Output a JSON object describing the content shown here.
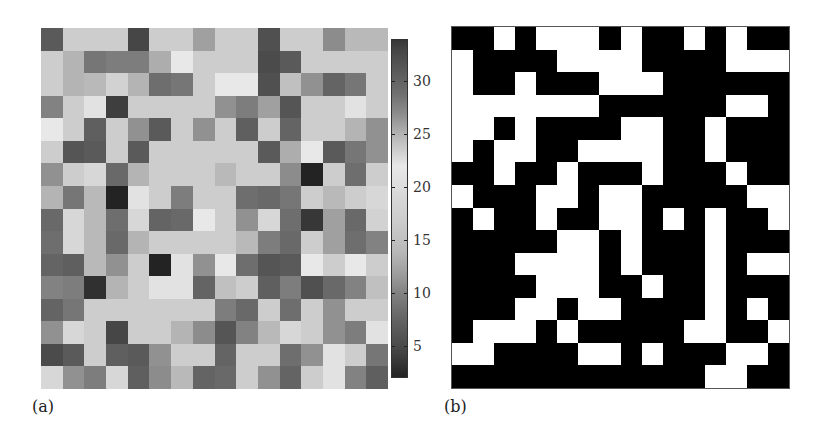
{
  "figure": {
    "panel_a_label": "(a)",
    "panel_b_label": "(b)"
  },
  "colorbar": {
    "min": 2,
    "max": 34,
    "ticks": [
      5,
      10,
      15,
      20,
      25,
      30
    ],
    "tick_labels": [
      "5",
      "10",
      "15",
      "20",
      "25",
      "30"
    ],
    "colormap_points": [
      [
        2,
        35
      ],
      [
        5,
        75
      ],
      [
        8,
        105
      ],
      [
        10,
        130
      ],
      [
        12,
        160
      ],
      [
        14,
        185
      ],
      [
        17,
        205
      ],
      [
        19,
        215
      ],
      [
        22,
        232
      ],
      [
        25,
        180
      ],
      [
        27,
        140
      ],
      [
        29,
        110
      ],
      [
        31,
        90
      ],
      [
        33,
        70
      ],
      [
        34,
        55
      ]
    ]
  },
  "chart_data": [
    {
      "type": "heatmap",
      "title": "(a)",
      "xlabel": "",
      "ylabel": "",
      "rows": 16,
      "cols": 16,
      "colorbar": {
        "range": [
          2,
          34
        ],
        "ticks": [
          5,
          10,
          15,
          20,
          25,
          30
        ],
        "colormap": "diverging gray (dark at both ends, light ~20-22)"
      },
      "values": [
        [
          31,
          17,
          17,
          17,
          33,
          17,
          17,
          12,
          17,
          17,
          32,
          17,
          17,
          27,
          14,
          14
        ],
        [
          17,
          25,
          9,
          28,
          28,
          13,
          22,
          17,
          17,
          17,
          5,
          31,
          17,
          17,
          17,
          17
        ],
        [
          17,
          25,
          14,
          18,
          25,
          29,
          9,
          17,
          22,
          22,
          32,
          15,
          11,
          30,
          9,
          17
        ],
        [
          10,
          17,
          21,
          4,
          17,
          17,
          17,
          17,
          11,
          28,
          12,
          6,
          17,
          17,
          21,
          17
        ],
        [
          22,
          17,
          7,
          17,
          11,
          31,
          17,
          11,
          17,
          7,
          17,
          30,
          17,
          17,
          25,
          11
        ],
        [
          17,
          6,
          31,
          17,
          31,
          17,
          17,
          17,
          17,
          17,
          31,
          13,
          22,
          31,
          9,
          11
        ],
        [
          11,
          17,
          19,
          8,
          25,
          17,
          17,
          17,
          14,
          17,
          17,
          27,
          2,
          17,
          29,
          17
        ],
        [
          25,
          9,
          14,
          2,
          21,
          17,
          28,
          17,
          17,
          29,
          8,
          9,
          17,
          14,
          17,
          19
        ],
        [
          8,
          19,
          14,
          29,
          19,
          30,
          8,
          22,
          17,
          11,
          19,
          29,
          34,
          12,
          8,
          18
        ],
        [
          29,
          19,
          14,
          8,
          25,
          17,
          17,
          17,
          17,
          14,
          28,
          8,
          17,
          12,
          29,
          10
        ],
        [
          30,
          7,
          14,
          11,
          17,
          2,
          21,
          11,
          22,
          29,
          6,
          31,
          22,
          17,
          22,
          17
        ],
        [
          10,
          28,
          3,
          25,
          17,
          21,
          21,
          30,
          15,
          17,
          7,
          28,
          32,
          8,
          10,
          15
        ],
        [
          30,
          9,
          17,
          17,
          17,
          17,
          17,
          17,
          28,
          8,
          17,
          29,
          17,
          11,
          17,
          17
        ],
        [
          11,
          19,
          17,
          33,
          17,
          17,
          25,
          27,
          6,
          10,
          14,
          19,
          17,
          11,
          28,
          21
        ],
        [
          5,
          31,
          17,
          7,
          31,
          11,
          17,
          17,
          30,
          17,
          17,
          29,
          11,
          21,
          17,
          9
        ],
        [
          19,
          11,
          28,
          19,
          7,
          27,
          14,
          30,
          8,
          17,
          11,
          30,
          17,
          21,
          10,
          7
        ]
      ]
    },
    {
      "type": "heatmap",
      "title": "(b)",
      "xlabel": "",
      "ylabel": "",
      "rows": 16,
      "cols": 16,
      "legend": "binary: 1 = black, 0 = white",
      "values": [
        [
          1,
          1,
          0,
          1,
          0,
          0,
          0,
          1,
          0,
          1,
          1,
          0,
          1,
          0,
          1,
          1
        ],
        [
          0,
          1,
          1,
          1,
          1,
          0,
          0,
          0,
          0,
          1,
          1,
          1,
          1,
          0,
          0,
          0
        ],
        [
          0,
          1,
          1,
          0,
          1,
          1,
          1,
          0,
          0,
          0,
          1,
          1,
          1,
          1,
          1,
          1
        ],
        [
          0,
          0,
          0,
          0,
          0,
          0,
          0,
          1,
          1,
          1,
          1,
          1,
          1,
          0,
          0,
          1
        ],
        [
          0,
          0,
          1,
          0,
          1,
          1,
          1,
          1,
          0,
          0,
          1,
          1,
          0,
          1,
          1,
          1
        ],
        [
          0,
          1,
          0,
          0,
          1,
          1,
          0,
          0,
          0,
          0,
          1,
          1,
          0,
          1,
          1,
          1
        ],
        [
          1,
          1,
          0,
          1,
          1,
          0,
          1,
          1,
          1,
          0,
          1,
          1,
          1,
          0,
          1,
          1
        ],
        [
          0,
          1,
          1,
          1,
          0,
          0,
          1,
          0,
          0,
          1,
          1,
          1,
          1,
          1,
          0,
          0
        ],
        [
          1,
          0,
          1,
          1,
          0,
          1,
          1,
          0,
          0,
          1,
          0,
          1,
          0,
          1,
          1,
          0
        ],
        [
          1,
          1,
          1,
          1,
          1,
          0,
          0,
          1,
          0,
          1,
          1,
          1,
          0,
          1,
          1,
          1
        ],
        [
          1,
          1,
          1,
          0,
          0,
          0,
          0,
          1,
          0,
          1,
          1,
          1,
          0,
          1,
          0,
          0
        ],
        [
          1,
          1,
          1,
          1,
          0,
          0,
          0,
          1,
          1,
          0,
          1,
          1,
          0,
          1,
          1,
          1
        ],
        [
          1,
          1,
          1,
          0,
          0,
          1,
          0,
          0,
          1,
          1,
          1,
          1,
          0,
          1,
          0,
          1
        ],
        [
          1,
          0,
          0,
          0,
          1,
          0,
          1,
          1,
          1,
          1,
          1,
          0,
          0,
          1,
          1,
          0
        ],
        [
          0,
          0,
          1,
          1,
          1,
          1,
          0,
          0,
          1,
          0,
          1,
          1,
          1,
          0,
          0,
          1
        ],
        [
          1,
          1,
          1,
          1,
          1,
          1,
          1,
          1,
          1,
          1,
          1,
          1,
          0,
          0,
          1,
          1
        ]
      ]
    }
  ]
}
